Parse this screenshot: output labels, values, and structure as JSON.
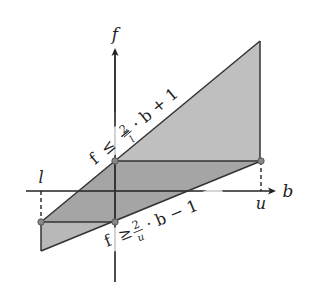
{
  "diagram": {
    "axes": {
      "x_label": "b",
      "y_label": "f",
      "x_tick_left": "l",
      "x_tick_right": "u"
    },
    "upper_constraint": {
      "lhs": "f",
      "rel": "≤",
      "minus": "−",
      "numerator": "2",
      "denominator": "l",
      "rest": "· b + 1"
    },
    "lower_constraint": {
      "lhs": "f",
      "rel": "≥",
      "numerator": "2",
      "denominator": "u",
      "rest": "· b − 1"
    },
    "colors": {
      "region_fill": "#9a9a9a",
      "region_opacity": 0.75,
      "stroke": "#333333",
      "point": "#888888"
    }
  }
}
